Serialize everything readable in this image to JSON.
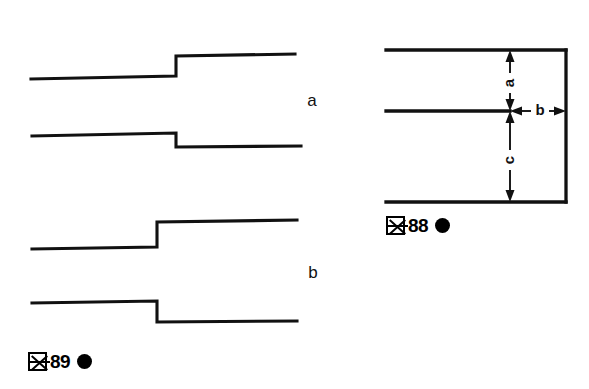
{
  "page": {
    "width": 589,
    "height": 389,
    "background_color": "#ffffff",
    "ink_color": "#111111"
  },
  "figures": [
    {
      "id": "fig89",
      "caption_kanji": "図",
      "caption_number": "89",
      "caption_marker": "●",
      "caption_text": "図89 ●",
      "description": "Four step-waveform traces arranged in two labeled groups",
      "group_labels": [
        {
          "key": "a",
          "label": "a",
          "x": 312,
          "y": 106
        },
        {
          "key": "b",
          "label": "b",
          "x": 313,
          "y": 278
        }
      ],
      "traces": [
        {
          "name": "trace-a-upper",
          "direction": "step-up",
          "start_x": 31,
          "start_y": 79,
          "step_x": 176,
          "pre_step_y": 76,
          "post_step_y": 56,
          "end_x": 295,
          "end_y": 54
        },
        {
          "name": "trace-a-lower",
          "direction": "step-down",
          "start_x": 32,
          "start_y": 136,
          "step_x": 176,
          "pre_step_y": 133,
          "post_step_y": 147,
          "end_x": 301,
          "end_y": 146
        },
        {
          "name": "trace-b-upper",
          "direction": "step-up",
          "start_x": 32,
          "start_y": 249,
          "step_x": 157,
          "pre_step_y": 247,
          "post_step_y": 222,
          "end_x": 297,
          "end_y": 220
        },
        {
          "name": "trace-b-lower",
          "direction": "step-down",
          "start_x": 32,
          "start_y": 303,
          "step_x": 157,
          "pre_step_y": 301,
          "post_step_y": 322,
          "end_x": 297,
          "end_y": 321
        }
      ]
    },
    {
      "id": "fig88",
      "caption_kanji": "図",
      "caption_number": "88",
      "caption_marker": "●",
      "caption_text": "図88 ●",
      "description": "Dimension diagram with three horizontal levels and labeled offsets a, b, c",
      "levels": [
        {
          "name": "top-line",
          "x1": 386,
          "x2": 566,
          "y": 50
        },
        {
          "name": "middle-line",
          "x1": 386,
          "x2": 510,
          "y": 111
        },
        {
          "name": "bottom-line",
          "x1": 386,
          "x2": 566,
          "y": 202
        }
      ],
      "right_edge": {
        "x": 566,
        "y1": 50,
        "y2": 202
      },
      "dimensions": [
        {
          "key": "a",
          "label": "a",
          "orientation": "vertical",
          "x": 510,
          "y1": 50,
          "y2": 111,
          "label_x": 510,
          "label_y": 83
        },
        {
          "key": "b",
          "label": "b",
          "orientation": "horizontal",
          "y": 111,
          "x1": 510,
          "x2": 566,
          "label_x": 540,
          "label_y": 111
        },
        {
          "key": "c",
          "label": "c",
          "orientation": "vertical",
          "x": 510,
          "y1": 111,
          "y2": 202,
          "label_x": 510,
          "label_y": 160
        }
      ]
    }
  ]
}
